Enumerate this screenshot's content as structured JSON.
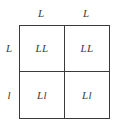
{
  "figure": {
    "kind": "punnett-square",
    "size": "2x2",
    "line_color": "#3a3a3a",
    "text_color": "#3b3b3b",
    "background_color": "#ffffff"
  },
  "column_labels": [
    {
      "text": "L"
    },
    {
      "text": "L"
    }
  ],
  "row_labels": [
    {
      "text": "L"
    },
    {
      "text": "l"
    }
  ],
  "cells": [
    [
      {
        "text": "LL"
      },
      {
        "text": "LL"
      }
    ],
    [
      {
        "text": "Ll"
      },
      {
        "text": "Ll"
      }
    ]
  ]
}
